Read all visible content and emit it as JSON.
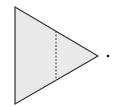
{
  "diagram": {
    "triangle": {
      "vertices": [
        [
          15,
          7
        ],
        [
          15,
          104
        ],
        [
          98,
          56
        ]
      ],
      "fill": "#e9e9e9",
      "stroke": "#333333"
    },
    "dashed_line": {
      "x": 56,
      "y1": 31,
      "y2": 80,
      "stroke": "#444444"
    },
    "point": {
      "cx": 108,
      "cy": 56,
      "r": 1.3,
      "fill": "#111111"
    }
  }
}
